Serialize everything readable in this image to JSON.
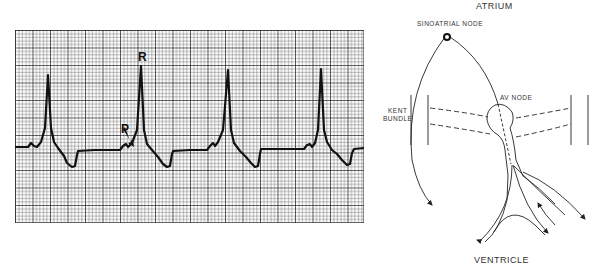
{
  "ecg_strip": {
    "markers": {
      "r_wave": "R",
      "p_wave": "P"
    },
    "grid": {
      "small_cell_px": 3.5,
      "large_every": 5,
      "line_color": "#222222"
    },
    "trace_color": "#111111",
    "r_peak_positions_px": [
      48,
      141,
      228,
      321
    ]
  },
  "conduction_diagram": {
    "labels": {
      "top": "ATRIUM",
      "sinoatrial_node": "SINOATRIAL NODE",
      "av_node": "AV NODE",
      "kent_line1": "KENT",
      "kent_line2": "BUNDLE",
      "bottom": "VENTRICLE"
    },
    "line_color": "#222222"
  }
}
